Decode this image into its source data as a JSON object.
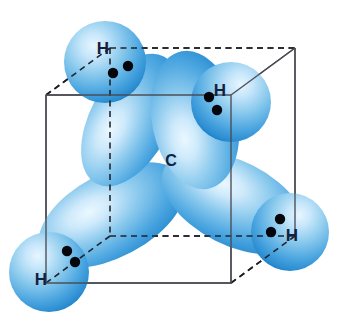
{
  "figure": {
    "molecule": "CH4",
    "background_color": "#ffffff"
  },
  "colors": {
    "orbital_highlight": "#d8eefc",
    "orbital_light": "#9fd4f2",
    "orbital_mid": "#49a6e0",
    "orbital_deep": "#1f7fc4",
    "label_color": "#14213d",
    "electron_dot_color": "#05050c",
    "cube_solid_edge": "#4a4a52",
    "cube_dashed_edge": "#1d1d24"
  },
  "atoms": {
    "central": {
      "symbol": "C",
      "name": "carbon-atom",
      "label_x": 171,
      "label_y": 166
    },
    "hydrogens": [
      {
        "symbol": "H",
        "name": "hydrogen-top-left",
        "label_x": 103,
        "label_y": 54,
        "sphere_cx": 105,
        "sphere_cy": 62,
        "sphere_r": 41,
        "electrons": [
          {
            "cx": 113,
            "cy": 73,
            "r": 5.2
          },
          {
            "cx": 128,
            "cy": 66,
            "r": 5.2
          }
        ]
      },
      {
        "symbol": "H",
        "name": "hydrogen-top-right",
        "label_x": 220,
        "label_y": 96,
        "sphere_cx": 231,
        "sphere_cy": 102,
        "sphere_r": 40,
        "electrons": [
          {
            "cx": 209,
            "cy": 97,
            "r": 5.2
          },
          {
            "cx": 217,
            "cy": 110,
            "r": 5.2
          }
        ]
      },
      {
        "symbol": "H",
        "name": "hydrogen-bottom-left",
        "label_x": 41,
        "label_y": 285,
        "sphere_cx": 49,
        "sphere_cy": 272,
        "sphere_r": 40,
        "electrons": [
          {
            "cx": 67,
            "cy": 251,
            "r": 5.2
          },
          {
            "cx": 75,
            "cy": 262,
            "r": 5.2
          }
        ]
      },
      {
        "symbol": "H",
        "name": "hydrogen-bottom-right",
        "label_x": 292,
        "label_y": 241,
        "sphere_cx": 290,
        "sphere_cy": 232,
        "sphere_r": 39,
        "electrons": [
          {
            "cx": 280,
            "cy": 219,
            "r": 5.2
          },
          {
            "cx": 271,
            "cy": 232,
            "r": 5.2
          }
        ]
      }
    ]
  },
  "orbitals": [
    {
      "name": "sp3-lobe-upper-left",
      "angle_deg": -62,
      "rx": 75,
      "ry": 40
    },
    {
      "name": "sp3-lobe-upper-right",
      "angle_deg": -101,
      "rx": 72,
      "ry": 42
    },
    {
      "name": "sp3-lobe-lower-left",
      "angle_deg": 152,
      "rx": 80,
      "ry": 42
    },
    {
      "name": "sp3-lobe-lower-right",
      "angle_deg": 27,
      "rx": 78,
      "ry": 42
    }
  ],
  "cube": {
    "name": "tetrahedral-reference-cube",
    "vertices": {
      "front_top_left": [
        46,
        95
      ],
      "front_top_right": [
        231,
        95
      ],
      "front_bottom_left": [
        46,
        283
      ],
      "front_bottom_right": [
        231,
        283
      ],
      "back_top_left": [
        110,
        48
      ],
      "back_top_right": [
        295,
        48
      ],
      "back_bottom_left": [
        110,
        236
      ],
      "back_bottom_right": [
        295,
        236
      ]
    },
    "solid_edge_count": 9,
    "dashed_edge_count": 3
  },
  "legend": {
    "caption": "",
    "notes": ""
  }
}
